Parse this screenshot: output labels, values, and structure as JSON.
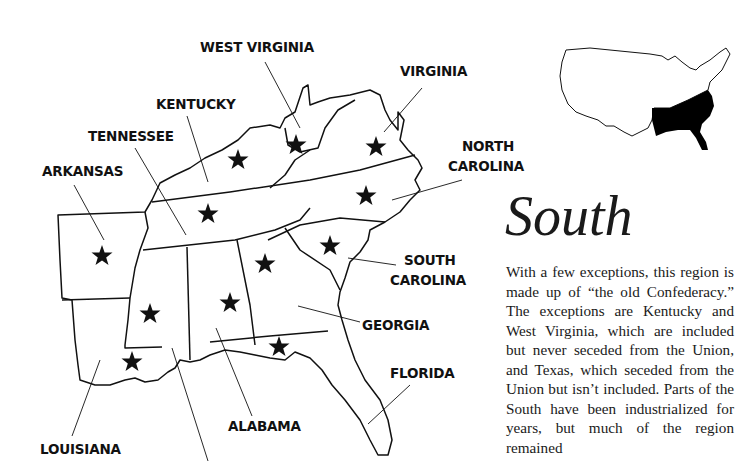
{
  "map": {
    "title": "South",
    "states": [
      {
        "name": "WEST VIRGINIA",
        "starred": true
      },
      {
        "name": "VIRGINIA",
        "starred": true
      },
      {
        "name": "KENTUCKY",
        "starred": true
      },
      {
        "name": "TENNESSEE",
        "starred": true
      },
      {
        "name": "NORTH CAROLINA",
        "starred": true
      },
      {
        "name": "ARKANSAS",
        "starred": true
      },
      {
        "name": "SOUTH CAROLINA",
        "starred": true
      },
      {
        "name": "GEORGIA",
        "starred": true
      },
      {
        "name": "FLORIDA",
        "starred": true
      },
      {
        "name": "ALABAMA",
        "starred": true
      },
      {
        "name": "MISSISSIPPI",
        "starred": true
      },
      {
        "name": "LOUISIANA",
        "starred": true
      }
    ],
    "labels": {
      "west_virginia": "WEST VIRGINIA",
      "virginia": "VIRGINIA",
      "kentucky": "KENTUCKY",
      "tennessee": "TENNESSEE",
      "north_carolina_line1": "NORTH",
      "north_carolina_line2": "CAROLINA",
      "arkansas": "ARKANSAS",
      "south_carolina_line1": "SOUTH",
      "south_carolina_line2": "CAROLINA",
      "georgia": "GEORGIA",
      "florida": "FLORIDA",
      "alabama": "ALABAMA",
      "louisiana": "LOUISIANA"
    },
    "colors": {
      "ink": "#111111",
      "highlight_region": "#000000",
      "background": "#ffffff"
    }
  },
  "inset": {
    "description": "US outline with South region filled black"
  },
  "text": {
    "heading": "South",
    "paragraph": "With a few exceptions, this region is made up of “the old Confed­eracy.” The exceptions are Ken­tucky and West Virginia, which are included but never seceded from the Union, and Texas, which seceded from the Union but isn’t included. Parts of the South have been industrialized for years, but much of the region remained"
  }
}
